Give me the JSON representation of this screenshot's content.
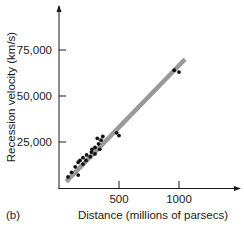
{
  "panel_label": "(b)",
  "chart_data": {
    "type": "scatter",
    "title": "",
    "xlabel": "Distance (millions of parsecs)",
    "ylabel": "Recession velocity (km/s)",
    "xlim": [
      0,
      1250
    ],
    "ylim": [
      0,
      90000
    ],
    "x_ticks": [
      500,
      1000
    ],
    "x_tick_labels": [
      "500",
      "1000"
    ],
    "y_ticks": [
      25000,
      50000,
      75000
    ],
    "y_tick_labels": [
      "25,000",
      "50,000",
      "75,000"
    ],
    "grid": false,
    "legend": null,
    "series": [
      {
        "name": "Galaxies",
        "points": [
          [
            75,
            6000
          ],
          [
            105,
            8500
          ],
          [
            135,
            11500
          ],
          [
            160,
            7000
          ],
          [
            160,
            14000
          ],
          [
            175,
            15000
          ],
          [
            200,
            13000
          ],
          [
            200,
            16500
          ],
          [
            225,
            15000
          ],
          [
            230,
            18000
          ],
          [
            260,
            17000
          ],
          [
            270,
            19500
          ],
          [
            275,
            21000
          ],
          [
            300,
            18500
          ],
          [
            300,
            22000
          ],
          [
            320,
            27000
          ],
          [
            330,
            24000
          ],
          [
            340,
            21000
          ],
          [
            350,
            26000
          ],
          [
            365,
            28000
          ],
          [
            480,
            30000
          ],
          [
            500,
            28500
          ],
          [
            960,
            64000
          ],
          [
            1000,
            63000
          ]
        ]
      }
    ],
    "fit_line": {
      "name": "Linear fit",
      "from": [
        60,
        3500
      ],
      "to": [
        1050,
        70000
      ],
      "color": "#999999"
    },
    "point_color": "#111111"
  }
}
